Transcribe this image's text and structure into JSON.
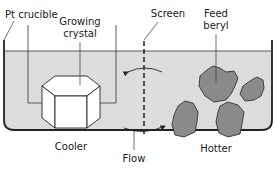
{
  "diagram": {
    "labels": {
      "pt_crucible": "Pt crucible",
      "growing_crystal_line1": "Growing",
      "growing_crystal_line2": "crystal",
      "screen": "Screen",
      "feed_beryl_line1": "Feed",
      "feed_beryl_line2": "beryl",
      "cooler": "Cooler",
      "flow": "Flow",
      "hotter": "Hotter"
    },
    "colors": {
      "liquid": "#dcdcdc",
      "rock": "#8a8a8a",
      "outline": "#222222",
      "crystal": "#ffffff"
    }
  }
}
